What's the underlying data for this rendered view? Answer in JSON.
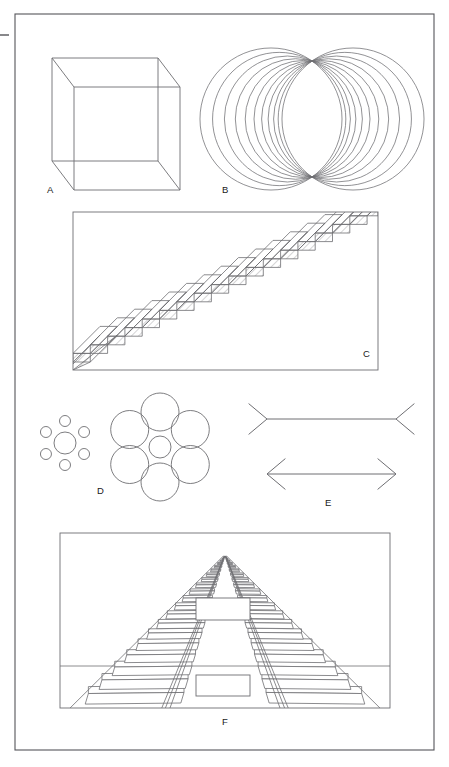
{
  "plate": {
    "title": "Optical illusions plate",
    "background_color": "#ffffff",
    "ink_color": "#6e6e72",
    "label_color": "#1a1a1a",
    "border": {
      "x": 15,
      "y": 14,
      "width": 419,
      "height": 736,
      "stroke": "#55555a"
    },
    "left_tick": {
      "x1": 0,
      "y1": 35,
      "x2": 9,
      "y2": 35
    }
  },
  "figures": [
    {
      "id": "A",
      "label": "A",
      "name": "necker-cube",
      "illusion": "Necker cube",
      "label_pos": {
        "x": 47,
        "y": 193
      },
      "geometry": {
        "front_face": {
          "x": 74,
          "y": 87,
          "width": 106,
          "height": 103
        },
        "back_face": {
          "x": 52,
          "y": 58,
          "width": 106,
          "height": 103
        },
        "offset": {
          "dx": -22,
          "dy": -29
        }
      }
    },
    {
      "id": "B",
      "label": "B",
      "name": "overlapping-circles",
      "illusion": "Coaxial circle sheaf through two common points",
      "label_pos": {
        "x": 222,
        "y": 193
      },
      "geometry": {
        "pivot_top": {
          "x": 312,
          "y": 61
        },
        "pivot_bottom": {
          "x": 312,
          "y": 177
        },
        "circle_count": 11,
        "radius": 59,
        "center_x_min": 271,
        "center_x_max": 353,
        "center_y": 119
      }
    },
    {
      "id": "C",
      "label": "C",
      "name": "schroder-staircase",
      "illusion": "Schröder reversible staircase",
      "label_pos": {
        "x": 363,
        "y": 357
      },
      "geometry": {
        "frame": {
          "x": 73,
          "y": 212,
          "width": 305,
          "height": 158
        },
        "step_count": 17,
        "tread_dx": 17.3,
        "riser_dy": -8.6,
        "start": {
          "x": 73,
          "y": 362
        },
        "slab_depth": {
          "dx": 27,
          "dy": -27
        },
        "hatch_spacing": 5
      }
    },
    {
      "id": "D",
      "label": "D",
      "name": "ebbinghaus-circles",
      "illusion": "Ebbinghaus (Titchener) circles",
      "label_pos": {
        "x": 97,
        "y": 494
      },
      "geometry": {
        "left_cluster": {
          "center": {
            "x": 65,
            "y": 443
          },
          "center_radius": 11,
          "surround_radius": 5.5,
          "surround_count": 6,
          "ring_distance": 22
        },
        "right_cluster": {
          "center": {
            "x": 160,
            "y": 447
          },
          "center_radius": 11,
          "surround_radius": 19,
          "surround_count": 6,
          "ring_distance": 35
        }
      }
    },
    {
      "id": "E",
      "label": "E",
      "name": "muller-lyer-arrows",
      "illusion": "Müller-Lyer arrows",
      "label_pos": {
        "x": 325,
        "y": 506
      },
      "geometry": {
        "top_shaft": {
          "x1": 267,
          "y1": 419,
          "x2": 396,
          "y2": 419
        },
        "top_fin_length": 24,
        "top_fin_angle_deg": 40,
        "bottom_shaft": {
          "x1": 267,
          "y1": 474,
          "x2": 396,
          "y2": 474
        },
        "bottom_fin_length": 24,
        "bottom_fin_angle_deg": 40
      }
    },
    {
      "id": "F",
      "label": "F",
      "name": "ponzo-railway-track",
      "illusion": "Ponzo railway-track illusion",
      "label_pos": {
        "x": 222,
        "y": 725
      },
      "geometry": {
        "frame": {
          "x": 60,
          "y": 533,
          "width": 330,
          "height": 175
        },
        "vanishing_point": {
          "x": 225,
          "y": 556
        },
        "sleeper_count": 22,
        "test_bar_upper": {
          "x": 196,
          "y": 598,
          "width": 54,
          "height": 22
        },
        "test_bar_lower": {
          "x": 196,
          "y": 675,
          "width": 54,
          "height": 21
        },
        "rail_gauge_bottom": 250
      }
    }
  ]
}
